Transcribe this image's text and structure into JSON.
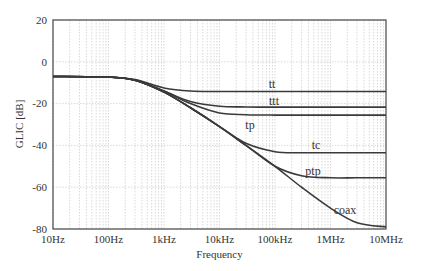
{
  "chart_data": {
    "type": "line",
    "title": "",
    "xlabel": "Frequency",
    "ylabel": "GLIC [dB]",
    "xscale": "log",
    "xlim_hz": [
      10,
      10000000
    ],
    "ylim": [
      -80,
      20
    ],
    "x_tick_labels": [
      "10Hz",
      "100Hz",
      "1kHz",
      "10kHz",
      "100kHz",
      "1MHz",
      "10MHz"
    ],
    "y_tick_labels": [
      "20",
      "0",
      "-20",
      "-40",
      "-60",
      "-80"
    ],
    "grid": true,
    "legend": "inline labels",
    "x": [
      10,
      100,
      300,
      1000,
      3000,
      10000,
      30000,
      100000,
      300000,
      1000000,
      3000000,
      10000000
    ],
    "series": [
      {
        "name": "tt",
        "values": [
          -7,
          -7.3,
          -8.5,
          -12.5,
          -14,
          -14.2,
          -14.2,
          -14.2,
          -14.2,
          -14.2,
          -14.2,
          -14.2
        ]
      },
      {
        "name": "ttt",
        "values": [
          -7,
          -7.3,
          -8.8,
          -14,
          -19,
          -21.3,
          -21.6,
          -21.7,
          -21.7,
          -21.7,
          -21.7,
          -21.7
        ]
      },
      {
        "name": "tp",
        "values": [
          -7,
          -7.3,
          -8.8,
          -14,
          -20,
          -24.5,
          -25.3,
          -25.5,
          -25.5,
          -25.5,
          -25.5,
          -25.5
        ]
      },
      {
        "name": "tc",
        "values": [
          -7,
          -7.3,
          -8.8,
          -14.5,
          -22,
          -31,
          -39,
          -43,
          -43.5,
          -43.5,
          -43.5,
          -43.5
        ]
      },
      {
        "name": "ptp",
        "values": [
          -7,
          -7.3,
          -8.8,
          -14.5,
          -22,
          -31,
          -40,
          -50,
          -54.5,
          -55.5,
          -55.5,
          -55.5
        ]
      },
      {
        "name": "coax",
        "values": [
          -7,
          -7.3,
          -8.8,
          -14.5,
          -22,
          -31,
          -40,
          -50,
          -60,
          -70,
          -77,
          -79
        ]
      }
    ]
  },
  "labels": {
    "xlabel": "Frequency",
    "ylabel": "GLIC [dB]",
    "xticks": [
      "10Hz",
      "100Hz",
      "1kHz",
      "10kHz",
      "100kHz",
      "1MHz",
      "10MHz"
    ],
    "yticks": [
      "20",
      "0",
      "-20",
      "-40",
      "-60",
      "-80"
    ],
    "curves": {
      "tt": "tt",
      "ttt": "ttt",
      "tp": "tp",
      "tc": "tc",
      "ptp": "ptp",
      "coax": "coax"
    }
  },
  "colors": {
    "curve": "#3a3a3a",
    "grid": "#bdbdbd",
    "frame": "#555555"
  }
}
